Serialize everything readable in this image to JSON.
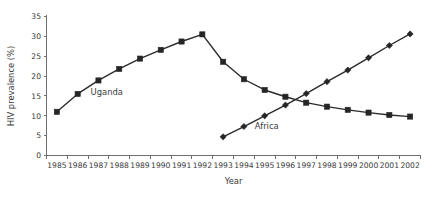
{
  "chart_data": {
    "type": "line",
    "title": "",
    "xlabel": "Year",
    "ylabel": "HIV prevalence (%)",
    "categories": [
      "1985",
      "1986",
      "1987",
      "1988",
      "1989",
      "1990",
      "1991",
      "1992",
      "1993",
      "1994",
      "1995",
      "1996",
      "1997",
      "1998",
      "1999",
      "2000",
      "2001",
      "2002"
    ],
    "xlim": [
      1984.5,
      2002.5
    ],
    "ylim": [
      0,
      35
    ],
    "yticks": [
      0,
      5,
      10,
      15,
      20,
      25,
      30,
      35
    ],
    "ytick_labels": [
      "0",
      "5",
      "10",
      "15",
      "20",
      "25",
      "30",
      "35"
    ],
    "grid": false,
    "legend": "inline-annotations",
    "series": [
      {
        "name": "Uganda",
        "marker": "square",
        "color": "#262626",
        "label_x": 1987.4,
        "label_y": 15.2,
        "x": [
          1985,
          1986,
          1987,
          1988,
          1989,
          1990,
          1991,
          1992,
          1993,
          1994,
          1995,
          1996,
          1997,
          1998,
          1999,
          2000,
          2001,
          2002
        ],
        "values": [
          11.0,
          15.5,
          18.9,
          21.8,
          24.4,
          26.6,
          28.7,
          30.5,
          23.6,
          19.2,
          16.5,
          14.8,
          13.3,
          12.3,
          11.5,
          10.8,
          10.2,
          9.8
        ]
      },
      {
        "name": "Africa",
        "marker": "diamond",
        "color": "#262626",
        "label_x": 1995.1,
        "label_y": 6.6,
        "x": [
          1993,
          1994,
          1995,
          1996,
          1997,
          1998,
          1999,
          2000,
          2001,
          2002
        ],
        "values": [
          4.7,
          7.3,
          10.0,
          12.7,
          15.6,
          18.6,
          21.5,
          24.6,
          27.7,
          30.6
        ]
      }
    ]
  },
  "figure": {
    "background": "#ffffff",
    "axis_color": "#6f6f6f",
    "line_color": "#2b2b2b"
  }
}
